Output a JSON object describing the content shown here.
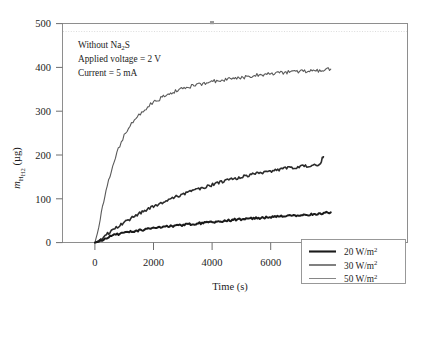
{
  "chart_data": {
    "type": "line",
    "title": "",
    "xlabel": "Time (s)",
    "ylabel": "m_H2 (µg)",
    "ylabel_parts": {
      "italic": "m",
      "subscript": "H2",
      "unit": "(µg)"
    },
    "xlim": [
      -1000,
      10800
    ],
    "ylim": [
      0,
      500
    ],
    "xticks": [
      0,
      2000,
      4000,
      6000,
      8000,
      10000
    ],
    "xtick_labels": [
      "0",
      "2000",
      "4000",
      "6000",
      "8000",
      "10,000"
    ],
    "yticks": [
      0,
      100,
      200,
      300,
      400,
      500
    ],
    "ytick_labels": [
      "0",
      "100",
      "200",
      "300",
      "400",
      "500"
    ],
    "grid": false,
    "legend_position": "lower-right",
    "series": [
      {
        "name": "20 W/m2",
        "label_value": "20",
        "label_unit": "W/m",
        "label_exp": "2",
        "color": "#1a1a1a",
        "width": 2.0,
        "points": [
          [
            0,
            0
          ],
          [
            120,
            2
          ],
          [
            300,
            8
          ],
          [
            520,
            14
          ],
          [
            760,
            19
          ],
          [
            1000,
            22
          ],
          [
            1300,
            26
          ],
          [
            1600,
            29
          ],
          [
            1900,
            32
          ],
          [
            2200,
            35
          ],
          [
            2500,
            37
          ],
          [
            2800,
            39
          ],
          [
            3100,
            41
          ],
          [
            3400,
            43
          ],
          [
            3700,
            45
          ],
          [
            4000,
            47
          ],
          [
            4300,
            49
          ],
          [
            4600,
            51
          ],
          [
            4900,
            53
          ],
          [
            5200,
            54
          ],
          [
            5500,
            56
          ],
          [
            5800,
            57
          ],
          [
            6100,
            59
          ],
          [
            6400,
            60
          ],
          [
            6700,
            61
          ],
          [
            7000,
            63
          ],
          [
            7300,
            64
          ],
          [
            7600,
            66
          ],
          [
            7900,
            68
          ],
          [
            8050,
            69
          ]
        ]
      },
      {
        "name": "30 W/m2",
        "label_value": "30",
        "label_unit": "W/m",
        "label_exp": "2",
        "color": "#2b2b2b",
        "width": 1.6,
        "points": [
          [
            0,
            0
          ],
          [
            150,
            5
          ],
          [
            350,
            16
          ],
          [
            600,
            28
          ],
          [
            850,
            40
          ],
          [
            1100,
            50
          ],
          [
            1400,
            62
          ],
          [
            1700,
            73
          ],
          [
            2000,
            83
          ],
          [
            2300,
            92
          ],
          [
            2600,
            100
          ],
          [
            2900,
            108
          ],
          [
            3200,
            115
          ],
          [
            3500,
            122
          ],
          [
            3800,
            128
          ],
          [
            4100,
            134
          ],
          [
            4400,
            140
          ],
          [
            4700,
            145
          ],
          [
            5000,
            150
          ],
          [
            5300,
            155
          ],
          [
            5600,
            159
          ],
          [
            5900,
            163
          ],
          [
            6200,
            166
          ],
          [
            6500,
            169
          ],
          [
            6800,
            172
          ],
          [
            7100,
            174
          ],
          [
            7400,
            176
          ],
          [
            7600,
            178
          ],
          [
            7700,
            182
          ],
          [
            7760,
            192
          ],
          [
            7800,
            196
          ]
        ]
      },
      {
        "name": "50 W/m2",
        "label_value": "50",
        "label_unit": "W/m",
        "label_exp": "2",
        "color": "#5a5a5a",
        "width": 1.1,
        "points": [
          [
            0,
            0
          ],
          [
            80,
            20
          ],
          [
            180,
            55
          ],
          [
            300,
            95
          ],
          [
            420,
            130
          ],
          [
            560,
            165
          ],
          [
            700,
            196
          ],
          [
            850,
            222
          ],
          [
            1000,
            244
          ],
          [
            1200,
            266
          ],
          [
            1400,
            284
          ],
          [
            1600,
            298
          ],
          [
            1800,
            310
          ],
          [
            2000,
            320
          ],
          [
            2250,
            330
          ],
          [
            2500,
            338
          ],
          [
            2750,
            345
          ],
          [
            3000,
            351
          ],
          [
            3300,
            357
          ],
          [
            3600,
            362
          ],
          [
            3900,
            366
          ],
          [
            4200,
            370
          ],
          [
            4500,
            373
          ],
          [
            4800,
            376
          ],
          [
            5100,
            378
          ],
          [
            5400,
            381
          ],
          [
            5700,
            383
          ],
          [
            6000,
            385
          ],
          [
            6300,
            387
          ],
          [
            6600,
            389
          ],
          [
            6900,
            390
          ],
          [
            7200,
            392
          ],
          [
            7500,
            393
          ],
          [
            7800,
            394
          ],
          [
            8050,
            396
          ]
        ]
      }
    ],
    "annotations": [
      {
        "line1_pre": "Without Na",
        "line1_sub": "2",
        "line1_post": "S"
      },
      {
        "text": "Applied voltage = 2 V"
      },
      {
        "text": "Current = 5 mA"
      }
    ]
  }
}
